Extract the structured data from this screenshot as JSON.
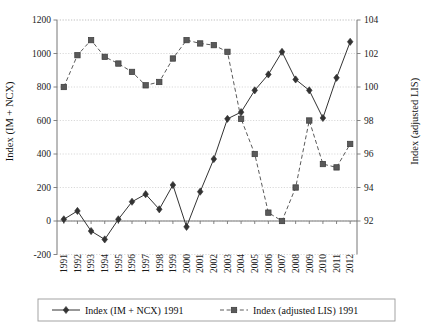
{
  "chart_data": {
    "type": "line",
    "title": "",
    "subtitle": "",
    "xlabel": "",
    "ylabel": "Index (IM + NCX)",
    "y2label": "Index (adjusted LIS)",
    "grid": true,
    "legend_position": "bottom",
    "categories": [
      "1991",
      "1992",
      "1993",
      "1994",
      "1995",
      "1996",
      "1997",
      "1998",
      "1999",
      "2000",
      "2001",
      "2002",
      "2003",
      "2004",
      "2005",
      "2006",
      "2007",
      "2008",
      "2009",
      "2010",
      "2011",
      "2012"
    ],
    "ylim": [
      -200,
      1200
    ],
    "yticks": [
      "-200",
      "0",
      "200",
      "400",
      "600",
      "800",
      "1000",
      "1200"
    ],
    "y2lim": [
      90,
      104
    ],
    "y2ticks": [
      "92",
      "94",
      "96",
      "98",
      "100",
      "102",
      "104"
    ],
    "series": [
      {
        "name": "Index (IM + NCX) 1991",
        "axis": "left",
        "marker": "diamond",
        "line_style": "solid",
        "color": "#333333",
        "values": [
          10,
          60,
          -60,
          -110,
          10,
          115,
          160,
          70,
          215,
          -35,
          175,
          370,
          610,
          650,
          780,
          875,
          1010,
          845,
          780,
          615,
          855,
          1070
        ]
      },
      {
        "name": "Index (adjusted LIS) 1991",
        "axis": "right",
        "marker": "square",
        "line_style": "dashed",
        "color": "#5a5a5a",
        "values": [
          100.0,
          101.9,
          102.8,
          101.8,
          101.4,
          100.9,
          100.1,
          100.3,
          101.7,
          102.8,
          102.6,
          102.5,
          102.1,
          98.1,
          96.0,
          92.5,
          92.0,
          94.0,
          98.0,
          95.4,
          95.2,
          96.6
        ]
      }
    ],
    "legend": [
      {
        "label": "Index (IM + NCX) 1991",
        "marker": "diamond",
        "line_style": "solid",
        "color": "#333333"
      },
      {
        "label": "Index (adjusted LIS) 1991",
        "marker": "square",
        "line_style": "dashed",
        "color": "#5a5a5a"
      }
    ],
    "colors": {
      "grid": "#c9c9c9",
      "frame": "#808080",
      "series1": "#333333",
      "series2": "#5a5a5a",
      "text": "#111111",
      "background": "#ffffff"
    }
  }
}
